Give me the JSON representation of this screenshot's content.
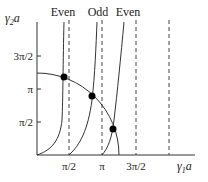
{
  "diagram": {
    "y_axis": {
      "label_var": "γ",
      "label_sub": "2",
      "label_suffix": "a"
    },
    "x_axis": {
      "label_var": "γ",
      "label_sub": "1",
      "label_suffix": "a"
    },
    "x_ticks": [
      "π/2",
      "π",
      "3π/2"
    ],
    "y_ticks": [
      "π/2",
      "π",
      "3π/2"
    ],
    "curve_labels": [
      "Even",
      "Odd",
      "Even"
    ],
    "asymptote_count": 4,
    "intersection_points": 3,
    "colors": {
      "line": "#333333",
      "dot": "#000000",
      "text": "#222222"
    }
  }
}
